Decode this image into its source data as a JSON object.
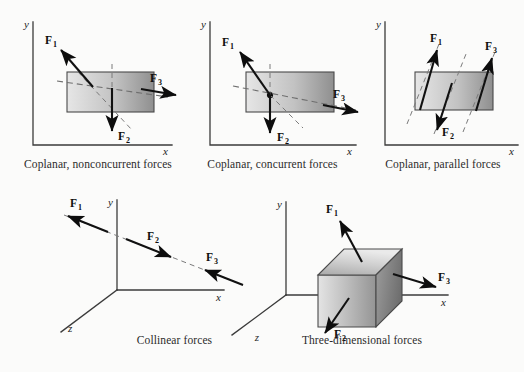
{
  "figure": {
    "background_color": "#fbfbfa",
    "ink_color": "#111111",
    "dash_color": "#6f6f6f",
    "box_fill_light": "#e2e2e2",
    "box_fill_dark": "#8e8e8e"
  },
  "axis_labels": {
    "x": "x",
    "y": "y",
    "z": "z"
  },
  "force_labels": {
    "f1_base": "F",
    "f1_sub": "1",
    "f2_base": "F",
    "f2_sub": "2",
    "f3_base": "F",
    "f3_sub": "3"
  },
  "panels": [
    {
      "id": "coplanar-nonconcurrent",
      "caption": "Coplanar, nonconcurrent forces",
      "dimensionality": "2D",
      "axes": [
        "x",
        "y"
      ],
      "forces": [
        {
          "name": "F1",
          "label_base": "F",
          "label_sub": "1",
          "direction": "up-left",
          "concurrent": false
        },
        {
          "name": "F2",
          "label_base": "F",
          "label_sub": "2",
          "direction": "down",
          "concurrent": false
        },
        {
          "name": "F3",
          "label_base": "F",
          "label_sub": "3",
          "direction": "right-slightly-down",
          "concurrent": false
        }
      ],
      "body": "rectangular-block"
    },
    {
      "id": "coplanar-concurrent",
      "caption": "Coplanar, concurrent forces",
      "dimensionality": "2D",
      "axes": [
        "x",
        "y"
      ],
      "forces": [
        {
          "name": "F1",
          "label_base": "F",
          "label_sub": "1",
          "direction": "up-left",
          "concurrent": true
        },
        {
          "name": "F2",
          "label_base": "F",
          "label_sub": "2",
          "direction": "down",
          "concurrent": true
        },
        {
          "name": "F3",
          "label_base": "F",
          "label_sub": "3",
          "direction": "right-slightly-down",
          "concurrent": true
        }
      ],
      "body": "rectangular-block",
      "has_concurrency_point": true
    },
    {
      "id": "coplanar-parallel",
      "caption": "Coplanar, parallel forces",
      "dimensionality": "2D",
      "axes": [
        "x",
        "y"
      ],
      "forces": [
        {
          "name": "F1",
          "label_base": "F",
          "label_sub": "1",
          "direction": "up-right",
          "concurrent": false
        },
        {
          "name": "F2",
          "label_base": "F",
          "label_sub": "2",
          "direction": "down-left",
          "concurrent": false
        },
        {
          "name": "F3",
          "label_base": "F",
          "label_sub": "3",
          "direction": "up-right",
          "concurrent": false
        }
      ],
      "body": "rectangular-block",
      "parallel_guide_count": 3
    },
    {
      "id": "collinear",
      "caption": "Collinear forces",
      "dimensionality": "3D",
      "axes": [
        "x",
        "y",
        "z"
      ],
      "forces": [
        {
          "name": "F1",
          "label_base": "F",
          "label_sub": "1",
          "direction": "up-left-along-line",
          "concurrent": false
        },
        {
          "name": "F2",
          "label_base": "F",
          "label_sub": "2",
          "direction": "down-right-along-line",
          "concurrent": false
        },
        {
          "name": "F3",
          "label_base": "F",
          "label_sub": "3",
          "direction": "up-left-along-line",
          "concurrent": false
        }
      ],
      "body": "none"
    },
    {
      "id": "three-dimensional",
      "caption": "Three-dimensional forces",
      "dimensionality": "3D",
      "axes": [
        "x",
        "y",
        "z"
      ],
      "forces": [
        {
          "name": "F1",
          "label_base": "F",
          "label_sub": "1",
          "direction": "up-left-out-of-top-face",
          "concurrent": false
        },
        {
          "name": "F2",
          "label_base": "F",
          "label_sub": "2",
          "direction": "down-left-out-of-front-face",
          "concurrent": false
        },
        {
          "name": "F3",
          "label_base": "F",
          "label_sub": "3",
          "direction": "right-out-of-side-face",
          "concurrent": false
        }
      ],
      "body": "rectangular-prism"
    }
  ]
}
